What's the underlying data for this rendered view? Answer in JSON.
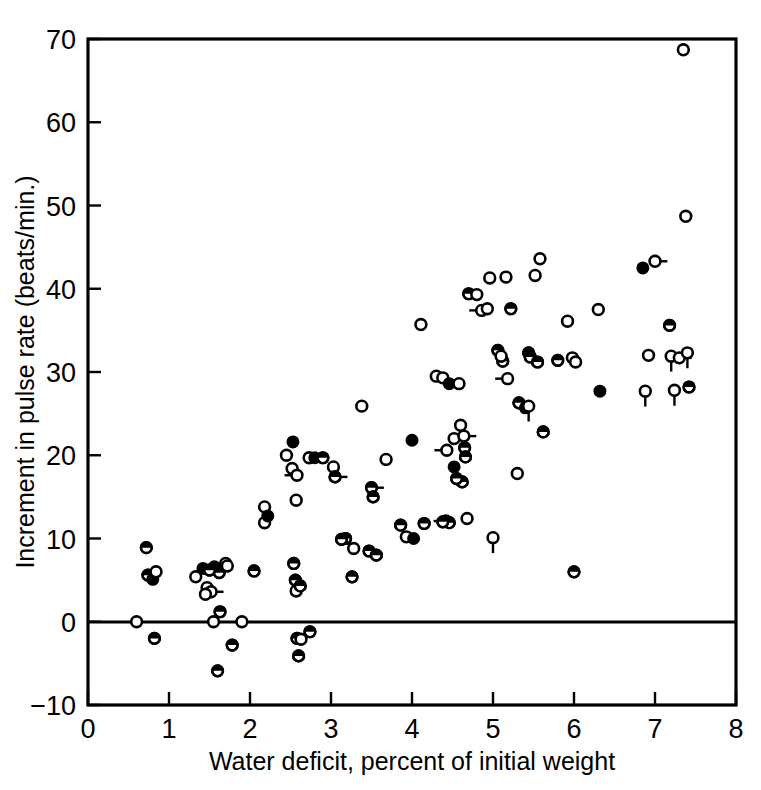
{
  "figure": {
    "kind": "scientific-scatter-plot",
    "background": "#ffffff",
    "ink_color": "#000000"
  },
  "axes": {
    "x_title": "Water deficit, percent of initial weight",
    "y_title": "Increment in pulse rate (beats/min.)",
    "x_ticklabels": [
      "0",
      "1",
      "2",
      "3",
      "4",
      "5",
      "6",
      "7",
      "8"
    ],
    "y_ticklabels": [
      "−10",
      "0",
      "10",
      "20",
      "30",
      "40",
      "50",
      "60",
      "70"
    ]
  },
  "chart_data": {
    "type": "scatter",
    "title": "",
    "xlabel": "Water deficit, percent of initial weight",
    "ylabel": "Increment in pulse rate (beats/min.)",
    "xlim": [
      0,
      8
    ],
    "ylim": [
      -10,
      70
    ],
    "xticks": [
      0,
      1,
      2,
      3,
      4,
      5,
      6,
      7,
      8
    ],
    "yticks": [
      -10,
      0,
      10,
      20,
      30,
      40,
      50,
      60,
      70
    ],
    "grid": false,
    "legend": null,
    "marker_styles": [
      "open",
      "filled",
      "half"
    ],
    "zero_reference_line": 0,
    "n_points": 118,
    "points": [
      {
        "x": 0.6,
        "y": 0.0,
        "m": "open",
        "t": "none"
      },
      {
        "x": 0.72,
        "y": 8.9,
        "m": "half",
        "t": "none"
      },
      {
        "x": 0.74,
        "y": 5.6,
        "m": "half",
        "t": "none"
      },
      {
        "x": 0.8,
        "y": 5.1,
        "m": "filled",
        "t": "none"
      },
      {
        "x": 0.84,
        "y": 6.0,
        "m": "open",
        "t": "left"
      },
      {
        "x": 0.82,
        "y": -2.0,
        "m": "half",
        "t": "none"
      },
      {
        "x": 1.33,
        "y": 5.4,
        "m": "open",
        "t": "none"
      },
      {
        "x": 1.42,
        "y": 6.4,
        "m": "filled",
        "t": "none"
      },
      {
        "x": 1.47,
        "y": 4.1,
        "m": "open",
        "t": "none"
      },
      {
        "x": 1.52,
        "y": 3.6,
        "m": "open",
        "t": "right"
      },
      {
        "x": 1.55,
        "y": 0.0,
        "m": "open",
        "t": "none"
      },
      {
        "x": 1.56,
        "y": 6.6,
        "m": "filled",
        "t": "none"
      },
      {
        "x": 1.62,
        "y": 5.9,
        "m": "half",
        "t": "none"
      },
      {
        "x": 1.63,
        "y": 1.2,
        "m": "half",
        "t": "none"
      },
      {
        "x": 1.6,
        "y": -5.9,
        "m": "half",
        "t": "none"
      },
      {
        "x": 1.7,
        "y": 7.0,
        "m": "open",
        "t": "none"
      },
      {
        "x": 1.72,
        "y": 6.7,
        "m": "open",
        "t": "none"
      },
      {
        "x": 1.78,
        "y": -2.8,
        "m": "half",
        "t": "none"
      },
      {
        "x": 1.9,
        "y": 0.0,
        "m": "open",
        "t": "none"
      },
      {
        "x": 2.05,
        "y": 6.1,
        "m": "half",
        "t": "none"
      },
      {
        "x": 2.18,
        "y": 13.8,
        "m": "open",
        "t": "none"
      },
      {
        "x": 2.18,
        "y": 11.9,
        "m": "open",
        "t": "none"
      },
      {
        "x": 2.22,
        "y": 12.7,
        "m": "filled",
        "t": "none"
      },
      {
        "x": 2.53,
        "y": 21.6,
        "m": "filled",
        "t": "none"
      },
      {
        "x": 2.52,
        "y": 18.4,
        "m": "open",
        "t": "none"
      },
      {
        "x": 2.58,
        "y": 17.6,
        "m": "open",
        "t": "left"
      },
      {
        "x": 2.57,
        "y": 14.6,
        "m": "open",
        "t": "none"
      },
      {
        "x": 2.54,
        "y": 7.0,
        "m": "half",
        "t": "none"
      },
      {
        "x": 2.56,
        "y": 5.0,
        "m": "half",
        "t": "none"
      },
      {
        "x": 2.57,
        "y": 3.7,
        "m": "open",
        "t": "none"
      },
      {
        "x": 2.62,
        "y": 4.3,
        "m": "half",
        "t": "none"
      },
      {
        "x": 2.58,
        "y": -2.0,
        "m": "half",
        "t": "none"
      },
      {
        "x": 2.63,
        "y": -2.1,
        "m": "open",
        "t": "none"
      },
      {
        "x": 2.6,
        "y": -4.1,
        "m": "half",
        "t": "none"
      },
      {
        "x": 2.73,
        "y": 19.7,
        "m": "open",
        "t": "none"
      },
      {
        "x": 2.8,
        "y": 19.7,
        "m": "filled",
        "t": "none"
      },
      {
        "x": 2.74,
        "y": -1.2,
        "m": "half",
        "t": "none"
      },
      {
        "x": 3.03,
        "y": 18.6,
        "m": "open",
        "t": "none"
      },
      {
        "x": 3.05,
        "y": 17.4,
        "m": "half",
        "t": "right"
      },
      {
        "x": 3.18,
        "y": 10.0,
        "m": "half",
        "t": "none"
      },
      {
        "x": 3.28,
        "y": 8.8,
        "m": "open",
        "t": "none"
      },
      {
        "x": 3.26,
        "y": 5.4,
        "m": "half",
        "t": "none"
      },
      {
        "x": 3.38,
        "y": 25.9,
        "m": "open",
        "t": "none"
      },
      {
        "x": 3.5,
        "y": 16.1,
        "m": "half",
        "t": "right"
      },
      {
        "x": 3.52,
        "y": 15.0,
        "m": "half",
        "t": "none"
      },
      {
        "x": 3.47,
        "y": 8.5,
        "m": "half",
        "t": "none"
      },
      {
        "x": 3.56,
        "y": 8.0,
        "m": "half",
        "t": "none"
      },
      {
        "x": 3.68,
        "y": 19.5,
        "m": "open",
        "t": "none"
      },
      {
        "x": 3.86,
        "y": 11.6,
        "m": "half",
        "t": "none"
      },
      {
        "x": 3.93,
        "y": 10.2,
        "m": "open",
        "t": "none"
      },
      {
        "x": 4.0,
        "y": 21.8,
        "m": "filled",
        "t": "none"
      },
      {
        "x": 4.02,
        "y": 10.0,
        "m": "filled",
        "t": "none"
      },
      {
        "x": 4.11,
        "y": 35.7,
        "m": "open",
        "t": "none"
      },
      {
        "x": 4.15,
        "y": 11.8,
        "m": "half",
        "t": "none"
      },
      {
        "x": 4.3,
        "y": 29.5,
        "m": "open",
        "t": "none"
      },
      {
        "x": 4.38,
        "y": 29.3,
        "m": "open",
        "t": "none"
      },
      {
        "x": 4.42,
        "y": 12.1,
        "m": "open",
        "t": "left"
      },
      {
        "x": 4.46,
        "y": 28.6,
        "m": "filled",
        "t": "none"
      },
      {
        "x": 4.46,
        "y": 11.9,
        "m": "half",
        "t": "none"
      },
      {
        "x": 4.43,
        "y": 20.6,
        "m": "open",
        "t": "left"
      },
      {
        "x": 4.52,
        "y": 22.0,
        "m": "open",
        "t": "none"
      },
      {
        "x": 4.52,
        "y": 18.6,
        "m": "filled",
        "t": "none"
      },
      {
        "x": 4.58,
        "y": 28.6,
        "m": "open",
        "t": "none"
      },
      {
        "x": 4.6,
        "y": 23.6,
        "m": "open",
        "t": "none"
      },
      {
        "x": 4.62,
        "y": 16.8,
        "m": "half",
        "t": "none"
      },
      {
        "x": 4.64,
        "y": 22.3,
        "m": "open",
        "t": "right"
      },
      {
        "x": 4.65,
        "y": 20.9,
        "m": "half",
        "t": "none"
      },
      {
        "x": 4.66,
        "y": 19.8,
        "m": "half",
        "t": "none"
      },
      {
        "x": 4.68,
        "y": 12.4,
        "m": "open",
        "t": "none"
      },
      {
        "x": 4.7,
        "y": 39.4,
        "m": "half",
        "t": "none"
      },
      {
        "x": 4.8,
        "y": 39.3,
        "m": "open",
        "t": "none"
      },
      {
        "x": 4.86,
        "y": 37.4,
        "m": "open",
        "t": "left"
      },
      {
        "x": 4.93,
        "y": 37.6,
        "m": "open",
        "t": "none"
      },
      {
        "x": 4.96,
        "y": 41.3,
        "m": "open",
        "t": "none"
      },
      {
        "x": 5.0,
        "y": 10.1,
        "m": "open",
        "t": "up"
      },
      {
        "x": 5.06,
        "y": 32.6,
        "m": "half",
        "t": "none"
      },
      {
        "x": 5.12,
        "y": 31.3,
        "m": "half",
        "t": "none"
      },
      {
        "x": 5.16,
        "y": 41.4,
        "m": "open",
        "t": "none"
      },
      {
        "x": 5.18,
        "y": 29.2,
        "m": "open",
        "t": "left"
      },
      {
        "x": 5.22,
        "y": 37.6,
        "m": "half",
        "t": "none"
      },
      {
        "x": 5.3,
        "y": 17.8,
        "m": "open",
        "t": "none"
      },
      {
        "x": 5.32,
        "y": 26.3,
        "m": "half",
        "t": "none"
      },
      {
        "x": 5.4,
        "y": 25.7,
        "m": "filled",
        "t": "none"
      },
      {
        "x": 5.44,
        "y": 25.9,
        "m": "open",
        "t": "up"
      },
      {
        "x": 5.44,
        "y": 32.3,
        "m": "half",
        "t": "none"
      },
      {
        "x": 5.46,
        "y": 31.8,
        "m": "half",
        "t": "none"
      },
      {
        "x": 5.52,
        "y": 41.6,
        "m": "open",
        "t": "none"
      },
      {
        "x": 5.55,
        "y": 31.2,
        "m": "half",
        "t": "none"
      },
      {
        "x": 5.58,
        "y": 43.6,
        "m": "open",
        "t": "none"
      },
      {
        "x": 5.62,
        "y": 22.8,
        "m": "half",
        "t": "none"
      },
      {
        "x": 5.8,
        "y": 31.4,
        "m": "half",
        "t": "none"
      },
      {
        "x": 5.92,
        "y": 36.1,
        "m": "open",
        "t": "none"
      },
      {
        "x": 5.98,
        "y": 31.7,
        "m": "open",
        "t": "none"
      },
      {
        "x": 6.0,
        "y": 6.0,
        "m": "half",
        "t": "none"
      },
      {
        "x": 6.3,
        "y": 37.5,
        "m": "open",
        "t": "none"
      },
      {
        "x": 6.32,
        "y": 27.7,
        "m": "filled",
        "t": "none"
      },
      {
        "x": 6.85,
        "y": 42.5,
        "m": "filled",
        "t": "none"
      },
      {
        "x": 6.88,
        "y": 27.7,
        "m": "open",
        "t": "up"
      },
      {
        "x": 6.92,
        "y": 32.0,
        "m": "open",
        "t": "none"
      },
      {
        "x": 7.0,
        "y": 43.3,
        "m": "open",
        "t": "right"
      },
      {
        "x": 7.18,
        "y": 35.6,
        "m": "half",
        "t": "none"
      },
      {
        "x": 7.2,
        "y": 31.9,
        "m": "open",
        "t": "up"
      },
      {
        "x": 7.24,
        "y": 27.8,
        "m": "open",
        "t": "up"
      },
      {
        "x": 7.3,
        "y": 31.7,
        "m": "open",
        "t": "right"
      },
      {
        "x": 7.35,
        "y": 68.7,
        "m": "open",
        "t": "none"
      },
      {
        "x": 7.38,
        "y": 48.7,
        "m": "open",
        "t": "none"
      },
      {
        "x": 7.4,
        "y": 32.3,
        "m": "open",
        "t": "up"
      },
      {
        "x": 7.42,
        "y": 28.2,
        "m": "half",
        "t": "none"
      },
      {
        "x": 1.45,
        "y": 3.3,
        "m": "open",
        "t": "none"
      },
      {
        "x": 2.9,
        "y": 19.7,
        "m": "half",
        "t": "none"
      },
      {
        "x": 4.38,
        "y": 12.0,
        "m": "half",
        "t": "none"
      },
      {
        "x": 5.1,
        "y": 31.9,
        "m": "open",
        "t": "none"
      },
      {
        "x": 3.13,
        "y": 9.9,
        "m": "half",
        "t": "none"
      },
      {
        "x": 2.45,
        "y": 20.0,
        "m": "open",
        "t": "none"
      },
      {
        "x": 4.55,
        "y": 17.2,
        "m": "half",
        "t": "none"
      },
      {
        "x": 1.5,
        "y": 6.2,
        "m": "half",
        "t": "none"
      },
      {
        "x": 6.02,
        "y": 31.2,
        "m": "open",
        "t": "none"
      }
    ]
  }
}
